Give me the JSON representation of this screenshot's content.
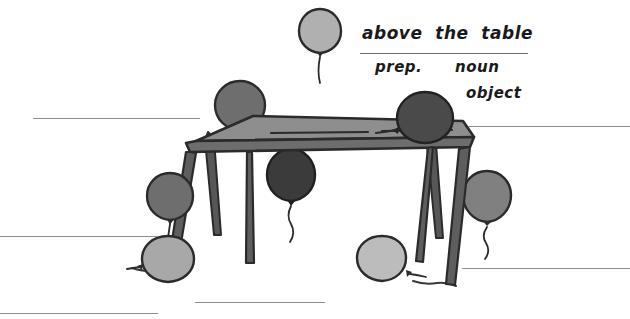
{
  "worksheet": {
    "title": "above the table",
    "canvas": {
      "width": 630,
      "height": 319,
      "background": "#ffffff"
    },
    "phrase": {
      "text": "above  the  table",
      "rule": {
        "x": 360,
        "y": 53,
        "width": 168
      }
    },
    "parts_of_speech": [
      {
        "id": "prep",
        "label": "prep.",
        "x": 375,
        "y": 58
      },
      {
        "id": "noun",
        "label": "noun",
        "x": 455,
        "y": 58
      },
      {
        "id": "object",
        "label": "object",
        "x": 466,
        "y": 84
      }
    ],
    "answer_lines": [
      {
        "id": "left-top",
        "x": 33,
        "y": 118,
        "width": 167
      },
      {
        "id": "left-middle",
        "x": 0,
        "y": 236,
        "width": 157
      },
      {
        "id": "bottom-left",
        "x": 0,
        "y": 313,
        "width": 158
      },
      {
        "id": "bottom-center",
        "x": 195,
        "y": 302,
        "width": 130
      },
      {
        "id": "right-top",
        "x": 468,
        "y": 126,
        "width": 162
      },
      {
        "id": "right-bottom",
        "x": 462,
        "y": 268,
        "width": 168
      }
    ],
    "colors": {
      "ink": "#2b2b2b",
      "rule": "#8d8d8d",
      "balloon_light": "#bcbcbc",
      "balloon_lightgray": "#adadad",
      "balloon_mid": "#8a8a8a",
      "balloon_midgray": "#707070",
      "balloon_dark": "#4a4a4a",
      "balloon_darkest": "#3b3b3b",
      "table_top": "#8e8e8e",
      "table_edge": "#6d6d6d",
      "table_leg": "#5e5e5e"
    },
    "balloons": [
      {
        "id": "balloon-floating-top",
        "position": "above the table",
        "cx": 320,
        "cy": 31,
        "rx": 20,
        "ry": 22,
        "fill": "#b0b0b0"
      },
      {
        "id": "balloon-on-table-left",
        "position": "on the table",
        "cx": 240,
        "cy": 105,
        "rx": 24,
        "ry": 24,
        "fill": "#6e6e6e"
      },
      {
        "id": "balloon-on-table-right",
        "position": "on the table",
        "cx": 425,
        "cy": 118,
        "rx": 27,
        "ry": 25,
        "fill": "#4a4a4a"
      },
      {
        "id": "balloon-under-table",
        "position": "under the table",
        "cx": 291,
        "cy": 175,
        "rx": 23,
        "ry": 25,
        "fill": "#3b3b3b"
      },
      {
        "id": "balloon-left-upper",
        "position": "beside the table",
        "cx": 170,
        "cy": 196,
        "rx": 22,
        "ry": 23,
        "fill": "#6e6e6e"
      },
      {
        "id": "balloon-left-lower",
        "position": "beside the table",
        "cx": 168,
        "cy": 259,
        "rx": 25,
        "ry": 23,
        "fill": "#a8a8a8"
      },
      {
        "id": "balloon-bottom-center",
        "position": "in front of the table",
        "cx": 382,
        "cy": 258,
        "rx": 24,
        "ry": 22,
        "fill": "#bcbcbc"
      },
      {
        "id": "balloon-right",
        "position": "behind the table leg",
        "cx": 487,
        "cy": 196,
        "rx": 23,
        "ry": 25,
        "fill": "#808080"
      }
    ],
    "table": {
      "id": "sketch-table",
      "top_surface": "parallelogram perspective tabletop",
      "legs": 4
    }
  }
}
